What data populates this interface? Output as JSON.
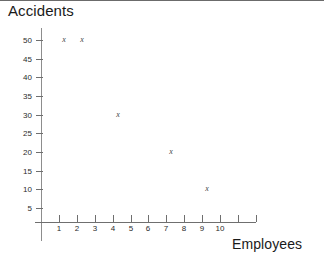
{
  "chart_data": {
    "type": "scatter",
    "title": "Accidents",
    "xlabel": "Employees",
    "ylabel": "Accidents",
    "marker_glyph": "x",
    "grid": false,
    "legend": null,
    "xlim": [
      0,
      12
    ],
    "ylim": [
      0,
      52.5
    ],
    "x_ticks": [
      1,
      2,
      3,
      4,
      5,
      6,
      7,
      8,
      9,
      10,
      11,
      12
    ],
    "x_tick_labels": [
      "1",
      "2",
      "3",
      "4",
      "5",
      "6",
      "7",
      "8",
      "9",
      "10",
      "",
      ""
    ],
    "y_ticks": [
      5,
      10,
      15,
      20,
      25,
      30,
      35,
      40,
      45,
      50
    ],
    "y_tick_labels": [
      "5",
      "10",
      "15",
      "20",
      "25",
      "30",
      "35",
      "40",
      "45",
      "50"
    ],
    "points": [
      {
        "x": 1,
        "y": 50
      },
      {
        "x": 2,
        "y": 50
      },
      {
        "x": 4,
        "y": 30
      },
      {
        "x": 7,
        "y": 20
      },
      {
        "x": 9,
        "y": 10
      }
    ]
  },
  "colors": {
    "background": "#ffffff",
    "axis": "#8d8d8d",
    "tick": "#6f6f6f",
    "text": "#1a1a1a",
    "tick_text": "#2b2b2b",
    "marker": "#3f3f3f",
    "top_edge": "#3a3a3a"
  }
}
